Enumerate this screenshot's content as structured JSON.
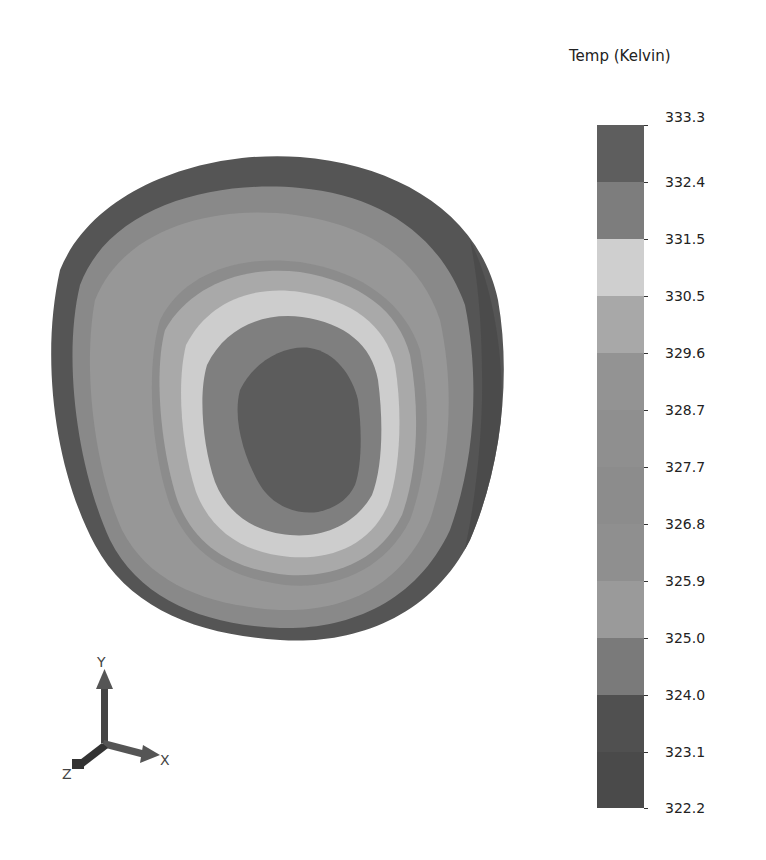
{
  "chart_data": {
    "type": "heatmap",
    "title": "",
    "legend_title": "Temp (Kelvin)",
    "colorbar": {
      "min": 322.2,
      "max": 333.3,
      "tick_labels": [
        "333.3",
        "332.4",
        "331.5",
        "330.5",
        "329.6",
        "328.7",
        "327.7",
        "326.8",
        "325.9",
        "325.0",
        "324.0",
        "323.1",
        "322.2"
      ],
      "tick_y": [
        125,
        182,
        239,
        296,
        353,
        410,
        467,
        524,
        581,
        638,
        695,
        752,
        808
      ],
      "bands": [
        {
          "from": 332.4,
          "to": 333.3,
          "color": "#5e5e5e"
        },
        {
          "from": 331.5,
          "to": 332.4,
          "color": "#7d7d7d"
        },
        {
          "from": 330.5,
          "to": 331.5,
          "color": "#cfcfcf"
        },
        {
          "from": 329.6,
          "to": 330.5,
          "color": "#a8a8a8"
        },
        {
          "from": 328.7,
          "to": 329.6,
          "color": "#939393"
        },
        {
          "from": 327.7,
          "to": 328.7,
          "color": "#8f8f8f"
        },
        {
          "from": 326.8,
          "to": 327.7,
          "color": "#8c8c8c"
        },
        {
          "from": 325.9,
          "to": 326.8,
          "color": "#8f8f8f"
        },
        {
          "from": 325.0,
          "to": 325.9,
          "color": "#9a9a9a"
        },
        {
          "from": 324.0,
          "to": 325.0,
          "color": "#7a7a7a"
        },
        {
          "from": 323.1,
          "to": 324.0,
          "color": "#505050"
        },
        {
          "from": 322.2,
          "to": 323.1,
          "color": "#4a4a4a"
        }
      ]
    },
    "contour_regions": [
      {
        "name": "outer-rim",
        "color": "#555555"
      },
      {
        "name": "outer-band",
        "color": "#8a8a8a"
      },
      {
        "name": "mid-band",
        "color": "#979797"
      },
      {
        "name": "inner-mid-band",
        "color": "#8d8d8d"
      },
      {
        "name": "light-ring-outer",
        "color": "#a9a9a9"
      },
      {
        "name": "light-ring",
        "color": "#cdcdcd"
      },
      {
        "name": "inner-ring",
        "color": "#7f7f7f"
      },
      {
        "name": "hot-core",
        "color": "#5c5c5c"
      }
    ],
    "axes_triad": {
      "x_label": "X",
      "y_label": "Y",
      "z_label": "Z"
    }
  }
}
